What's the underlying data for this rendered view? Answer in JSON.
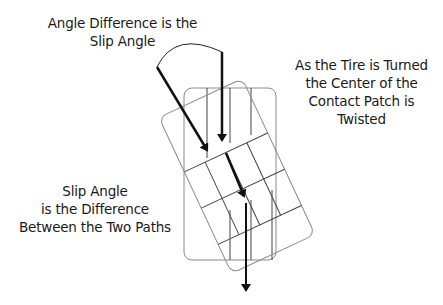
{
  "diagram": {
    "labels": {
      "top": [
        "Angle Difference is the",
        "Slip Angle"
      ],
      "right": [
        "As the Tire is Turned",
        "the Center of the",
        "Contact Patch is",
        "Twisted"
      ],
      "bottom": [
        "Slip Angle",
        "is the Difference",
        "Between the Two Paths"
      ]
    },
    "elements": {
      "upright_patch": "Contact patch (straight, aligned with travel)",
      "rotated_patch": "Contact patch (twisted, turned tire)",
      "arrow_heading": "Tire heading direction (diagonal)",
      "arrow_travel": "Actual path of travel (vertical)",
      "arc": "Slip angle arc between the two paths"
    },
    "colors": {
      "text": "#1a1a1a",
      "arrows": "#111111",
      "patch_lines": "#8a8a8a",
      "inner_lines": "#444444",
      "background": "#ffffff"
    }
  }
}
